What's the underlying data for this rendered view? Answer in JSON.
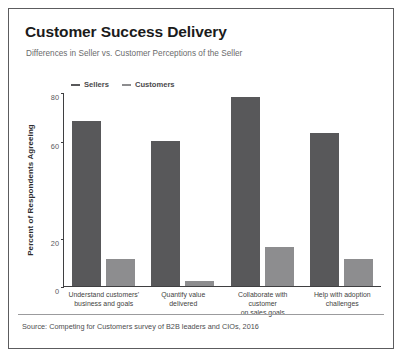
{
  "card": {
    "title": "Customer Success Delivery",
    "subtitle": "Differences in Seller vs. Customer Perceptions of the Seller",
    "source": "Source: Competing for Customers survey of B2B leaders and CIOs, 2016"
  },
  "colors": {
    "sellers": "#58585a",
    "customers": "#8d8d8f",
    "axis": "#3f3f41",
    "border": "#5c5c5e",
    "background": "#ffffff"
  },
  "chart_data": {
    "type": "bar",
    "title": "Customer Success Delivery",
    "subtitle": "Differences in Seller vs. Customer Perceptions of the Seller",
    "xlabel": "",
    "ylabel": "Percent of Respondents Agreeing",
    "ylim": [
      0,
      80
    ],
    "yticks": [
      0,
      20,
      60,
      80
    ],
    "ytick_labels": [
      "0",
      "20",
      "60",
      "80"
    ],
    "grid": false,
    "legend_position": "top-left",
    "categories": [
      "Understand customers'\nbusiness and goals",
      "Quantify value\ndelivered",
      "Collaborate with customer\non sales goals",
      "Help with adoption\nchallenges"
    ],
    "category_lines": [
      [
        "Understand customers'",
        "business and goals"
      ],
      [
        "Quantify value",
        "delivered"
      ],
      [
        "Collaborate with customer",
        "on sales goals"
      ],
      [
        "Help with adoption",
        "challenges"
      ]
    ],
    "series": [
      {
        "name": "Sellers",
        "color": "#58585a",
        "values": [
          68,
          60,
          78,
          63
        ]
      },
      {
        "name": "Customers",
        "color": "#8d8d8f",
        "values": [
          11,
          2,
          16,
          11
        ]
      }
    ],
    "note": "Source: Competing for Customers survey of B2B leaders and CIOs, 2016"
  }
}
